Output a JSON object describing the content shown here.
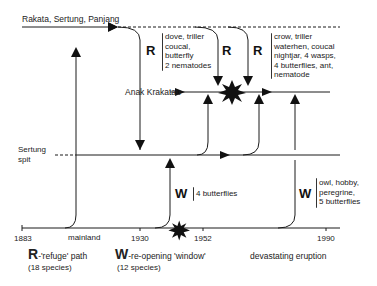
{
  "diagram": {
    "title_top_line": "Rakata, Sertung, Panjang",
    "anak_label": "Anak Krakatau",
    "sertung_label_1": "Sertung",
    "sertung_label_2": "spit",
    "axis": {
      "ticks": [
        "1883",
        "1930",
        "1952",
        "1990"
      ],
      "mainland_label": "mainland"
    },
    "r_groups": [
      {
        "letter": "R",
        "species": [
          "dove, triller",
          "coucal,",
          "butterfly",
          "2 nematodes"
        ]
      },
      {
        "letter": "R",
        "species": []
      },
      {
        "letter": "R",
        "species": [
          "crow, triller",
          "waterhen, coucal",
          "nightjar, 4 wasps,",
          "4 butterflies, ant,",
          "nematode"
        ]
      }
    ],
    "w_groups": [
      {
        "letter": "W",
        "species": [
          "4 butterflies"
        ]
      },
      {
        "letter": "W",
        "species": [
          "owl, hobby,",
          "peregrine,",
          "5 butterflies"
        ]
      }
    ],
    "legend": {
      "r_letter": "R",
      "r_text": "-'refuge' path",
      "r_count": "(18 species)",
      "w_letter": "W",
      "w_text": "-re-opening 'window'",
      "w_count": "(12 species)",
      "eruption_text": "devastating eruption",
      "eruption_icon": "explosion-icon"
    },
    "colors": {
      "line": "#1a1a1a",
      "text": "#222222",
      "background": "#ffffff"
    }
  }
}
